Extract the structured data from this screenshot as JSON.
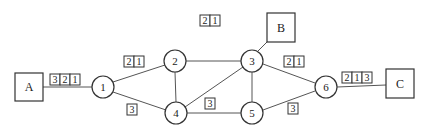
{
  "diagram": {
    "hosts": [
      {
        "id": "A",
        "label": "A",
        "x": 15,
        "y": 73,
        "w": 28,
        "h": 28
      },
      {
        "id": "B",
        "label": "B",
        "x": 267,
        "y": 13,
        "w": 28,
        "h": 29
      },
      {
        "id": "C",
        "label": "C",
        "x": 386,
        "y": 69,
        "w": 28,
        "h": 29
      }
    ],
    "routers": [
      {
        "id": "1",
        "label": "1",
        "cx": 103,
        "cy": 87
      },
      {
        "id": "2",
        "label": "2",
        "cx": 175,
        "cy": 61
      },
      {
        "id": "3",
        "label": "3",
        "cx": 252,
        "cy": 61
      },
      {
        "id": "4",
        "label": "4",
        "cx": 176,
        "cy": 113
      },
      {
        "id": "5",
        "label": "5",
        "cx": 252,
        "cy": 113
      },
      {
        "id": "6",
        "label": "6",
        "cx": 326,
        "cy": 87
      }
    ],
    "packet_groups": [
      {
        "name": "packets-A-1",
        "cells": [
          "3",
          "2",
          "1"
        ],
        "x": 50,
        "y": 74
      },
      {
        "name": "packets-1-2",
        "cells": [
          "2",
          "1"
        ],
        "x": 124,
        "y": 56
      },
      {
        "name": "packets-1-4",
        "cells": [
          "3"
        ],
        "x": 127,
        "y": 104
      },
      {
        "name": "packets-2-3",
        "cells": [
          "2",
          "1"
        ],
        "x": 200,
        "y": 15
      },
      {
        "name": "packets-4-5",
        "cells": [
          "3"
        ],
        "x": 205,
        "y": 98
      },
      {
        "name": "packets-3-6",
        "cells": [
          "2",
          "1"
        ],
        "x": 284,
        "y": 56
      },
      {
        "name": "packets-5-6",
        "cells": [
          "3"
        ],
        "x": 288,
        "y": 103
      },
      {
        "name": "packets-6-C",
        "cells": [
          "2",
          "1",
          "3"
        ],
        "x": 342,
        "y": 72
      }
    ]
  }
}
